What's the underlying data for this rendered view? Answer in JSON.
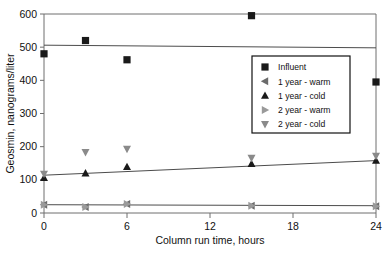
{
  "chart_data": {
    "type": "scatter",
    "title": "",
    "xlabel": "Column run time, hours",
    "ylabel": "Geosmin, nanograms/liter",
    "xlim": [
      0,
      24
    ],
    "ylim": [
      0,
      600
    ],
    "xticks": [
      0,
      6,
      12,
      18,
      24
    ],
    "yticks": [
      0,
      100,
      200,
      300,
      400,
      500,
      600
    ],
    "xtick_labels": [
      "0",
      "6",
      "12",
      "18",
      "24"
    ],
    "ytick_labels": [
      "0",
      "100",
      "200",
      "300",
      "400",
      "500",
      "600"
    ],
    "grid": false,
    "legend_position": "upper-right-inside",
    "x": [
      0,
      3,
      6,
      15,
      24
    ],
    "series": [
      {
        "name": "Influent",
        "marker": "square",
        "color": "#1a1a1a",
        "values": [
          480,
          520,
          462,
          595,
          395
        ],
        "trendline": {
          "x0": 0,
          "y0": 506,
          "x1": 24,
          "y1": 498
        }
      },
      {
        "name": "1 year - warm",
        "marker": "triangle-left",
        "color": "#6b6b6b",
        "values": [
          25,
          18,
          27,
          22,
          20
        ],
        "trendline": {
          "x0": 0,
          "y0": 25,
          "x1": 24,
          "y1": 22
        }
      },
      {
        "name": "1 year - cold",
        "marker": "triangle-up",
        "color": "#1a1a1a",
        "values": [
          106,
          120,
          139,
          148,
          158
        ],
        "trendline": {
          "x0": 0,
          "y0": 114,
          "x1": 24,
          "y1": 158
        }
      },
      {
        "name": "2 year - warm",
        "marker": "triangle-right",
        "color": "#9a9a9a",
        "values": [
          25,
          18,
          27,
          22,
          20
        ],
        "trendline": null
      },
      {
        "name": "2 year - cold",
        "marker": "triangle-down",
        "color": "#8a8a8a",
        "values": [
          118,
          183,
          193,
          166,
          172
        ],
        "trendline": null
      }
    ]
  },
  "legend": {
    "items": [
      {
        "label": "Influent",
        "marker": "square"
      },
      {
        "label": "1 year - warm",
        "marker": "triangle-left"
      },
      {
        "label": "1 year - cold",
        "marker": "triangle-up"
      },
      {
        "label": "2 year - warm",
        "marker": "triangle-right"
      },
      {
        "label": "2 year - cold",
        "marker": "triangle-down"
      }
    ]
  },
  "axes": {
    "x_title": "Column run time, hours",
    "y_title": "Geosmin, nanograms/liter"
  }
}
